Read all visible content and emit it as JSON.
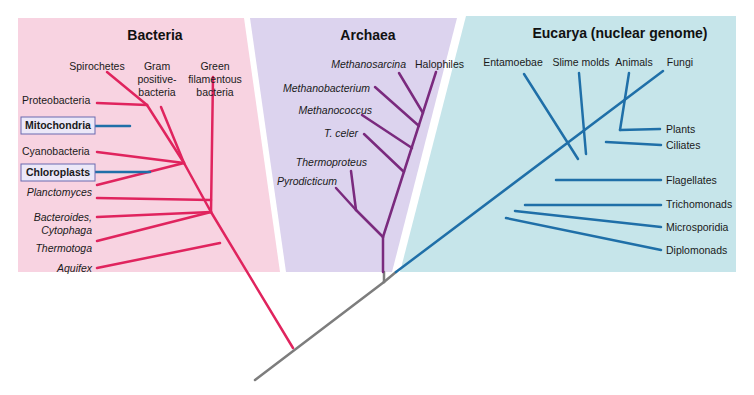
{
  "colors": {
    "bacteria_bg": "#f8d3e1",
    "archaea_bg": "#dcd3ee",
    "eucarya_bg": "#c6e5ea",
    "bacteria_line": "#e0245e",
    "archaea_line": "#7a2a7e",
    "eucarya_line": "#1f6fa8",
    "root_line": "#7d7d7d",
    "organelle_box_bg": "#ece8f8",
    "organelle_box_border": "#6a6ab0"
  },
  "domains": {
    "bacteria": {
      "title": "Bacteria",
      "labels": {
        "spirochetes": "Spirochetes",
        "gram_1": "Gram",
        "gram_2": "positive-",
        "gram_3": "bacteria",
        "green_1": "Green",
        "green_2": "filamentous",
        "green_3": "bacteria",
        "proteobacteria": "Proteobacteria",
        "mitochondria": "Mitochondria",
        "cyanobacteria": "Cyanobacteria",
        "chloroplasts": "Chloroplasts",
        "planctomyces": "Planctomyces",
        "bacteroides_1": "Bacteroides,",
        "bacteroides_2": "Cytophaga",
        "thermotoga": "Thermotoga",
        "aquifex": "Aquifex"
      }
    },
    "archaea": {
      "title": "Archaea",
      "labels": {
        "methanosarcina": "Methanosarcina",
        "halophiles": "Halophiles",
        "methanobacterium": "Methanobacterium",
        "methanococcus": "Methanococcus",
        "t_celer": "T. celer",
        "thermoproteus": "Thermoproteus",
        "pyrodicticum": "Pyrodicticum"
      }
    },
    "eucarya": {
      "title": "Eucarya (nuclear genome)",
      "labels": {
        "entamoebae": "Entamoebae",
        "slime_molds": "Slime molds",
        "animals": "Animals",
        "fungi": "Fungi",
        "plants": "Plants",
        "ciliates": "Ciliates",
        "flagellates": "Flagellates",
        "trichomonads": "Trichomonads",
        "microsporidia": "Microsporidia",
        "diplomonads": "Diplomonads"
      }
    }
  }
}
